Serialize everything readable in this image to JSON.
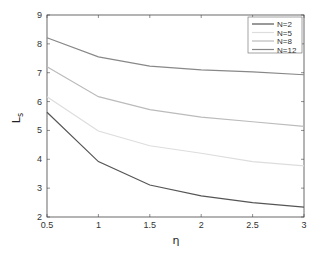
{
  "chart_data": {
    "type": "line",
    "title": "",
    "xlabel": "η",
    "ylabel": "L",
    "ylabel_subscript": "s",
    "x": [
      0.5,
      1,
      1.5,
      2,
      2.5,
      3
    ],
    "xlim": [
      0.5,
      3
    ],
    "ylim": [
      2,
      9
    ],
    "xticks": [
      "0.5",
      "1",
      "1.5",
      "2",
      "2.5",
      "3"
    ],
    "yticks": [
      "2",
      "3",
      "4",
      "5",
      "6",
      "7",
      "8",
      "9"
    ],
    "grid": false,
    "legend_position": "upper right",
    "series": [
      {
        "name": "N=2",
        "color": "#555555",
        "values": [
          5.63,
          3.92,
          3.11,
          2.73,
          2.5,
          2.34
        ]
      },
      {
        "name": "N=5",
        "color": "#dddddd",
        "values": [
          6.17,
          4.98,
          4.47,
          4.21,
          3.92,
          3.77
        ]
      },
      {
        "name": "N=8",
        "color": "#bbbbbb",
        "values": [
          7.21,
          6.17,
          5.72,
          5.46,
          5.3,
          5.14
        ]
      },
      {
        "name": "N=12",
        "color": "#888888",
        "values": [
          8.21,
          7.55,
          7.23,
          7.1,
          7.03,
          6.93
        ]
      }
    ]
  }
}
